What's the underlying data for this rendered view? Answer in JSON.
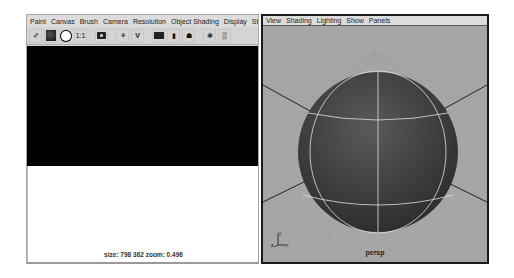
{
  "paint_panel": {
    "menu": [
      "Paint",
      "Canvas",
      "Brush",
      "Camera",
      "Resolution",
      "Object Shading",
      "Display",
      "Stroke R"
    ],
    "toolbar": [
      {
        "icon": "eraser-icon",
        "glyph": "✐"
      },
      {
        "icon": "color-swatch-icon"
      },
      {
        "icon": "white-sphere-icon"
      },
      {
        "icon": "one-to-one-icon",
        "glyph": "1:1"
      },
      {
        "icon": "snapshot-camera-icon"
      },
      {
        "icon": "brush-paint-icon",
        "glyph": "⚘"
      },
      {
        "icon": "brush-pair-icon",
        "glyph": "V"
      },
      {
        "icon": "open-folder-icon"
      },
      {
        "icon": "flip-icon",
        "glyph": "▮"
      },
      {
        "icon": "redraw-icon",
        "glyph": "☗"
      },
      {
        "icon": "texture-icon",
        "glyph": "❃"
      },
      {
        "icon": "wrap-icon",
        "glyph": "▒"
      }
    ],
    "status": "size: 798  362 zoom: 0.496"
  },
  "viewport_panel": {
    "menu": [
      "View",
      "Shading",
      "Lighting",
      "Show",
      "Panels"
    ],
    "camera_label": "persp",
    "axis": {
      "y": "y",
      "z": "z",
      "x": "x"
    },
    "colors": {
      "background": "#a9a9a9",
      "sphere": "#4a4a4a",
      "wire": "#e8e8e8"
    }
  }
}
